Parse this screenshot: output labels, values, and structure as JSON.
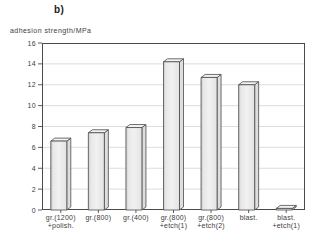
{
  "figure": {
    "panel_label": "b)"
  },
  "chart_data": {
    "type": "bar",
    "title": "b)",
    "ylabel": "adhesion strength/MPa",
    "xlabel": "",
    "ylim": [
      0,
      16
    ],
    "ytick_step": 2,
    "yticks": [
      0,
      2,
      4,
      6,
      8,
      10,
      12,
      14,
      16
    ],
    "grid": true,
    "legend": false,
    "bar_style": "3d-column",
    "categories": [
      [
        "gr.(1200)",
        "+polish."
      ],
      [
        "gr.(800)"
      ],
      [
        "gr.(400)"
      ],
      [
        "gr.(800)",
        "+etch(1)"
      ],
      [
        "gr.(800)",
        "+etch(2)"
      ],
      [
        "blast."
      ],
      [
        "blast.",
        "+etch(1)"
      ]
    ],
    "values": [
      6.6,
      7.4,
      7.9,
      14.2,
      12.7,
      12.0,
      0.15
    ],
    "colors": {
      "bar_face": "#f1f1f1",
      "bar_face_shadow": "#c7c7c7",
      "bar_top": "#f3f3f3",
      "bar_side": "#dedede",
      "outline": "#4a4a4a",
      "grid": "#d4d4d4",
      "text": "#3c3c3c",
      "background": "#ffffff"
    }
  }
}
